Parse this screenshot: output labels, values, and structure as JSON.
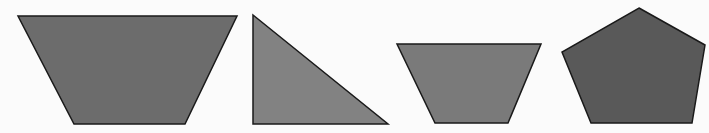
{
  "canvas": {
    "width": 709,
    "height": 133,
    "background": "#fbfbfb"
  },
  "shapes": [
    {
      "id": "trapezoid-1",
      "kind": "trapezoid",
      "points": "18,16 237,16 185,124 74,124",
      "fill": "#6c6c6c",
      "stroke": "#1a1a1a"
    },
    {
      "id": "right-triangle",
      "kind": "triangle",
      "points": "253,15 253,124 388,124",
      "fill": "#828282",
      "stroke": "#1a1a1a"
    },
    {
      "id": "trapezoid-2",
      "kind": "trapezoid",
      "points": "397,44 541,44 508,123 435,123",
      "fill": "#7a7a7a",
      "stroke": "#1a1a1a"
    },
    {
      "id": "pentagon",
      "kind": "pentagon",
      "points": "639,8 705,45 692,123 591,123 562,52",
      "fill": "#595959",
      "stroke": "#1a1a1a"
    }
  ]
}
